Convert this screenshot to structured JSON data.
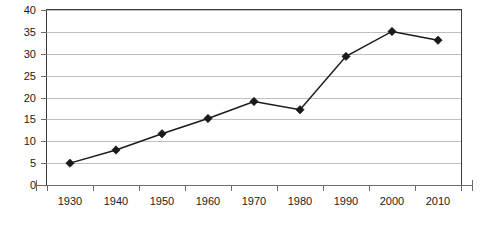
{
  "chart_data": {
    "type": "line",
    "title": "",
    "subtitle": "",
    "xlabel": "",
    "ylabel": "",
    "categories": [
      "1930",
      "1940",
      "1950",
      "1960",
      "1970",
      "1980",
      "1990",
      "2000",
      "2010"
    ],
    "values": [
      5.0,
      8.0,
      11.7,
      15.2,
      19.1,
      17.2,
      29.4,
      35.1,
      33.1
    ],
    "series": [
      {
        "name": "Series 1",
        "values": [
          5.0,
          8.0,
          11.7,
          15.2,
          19.1,
          17.2,
          29.4,
          35.1,
          33.1
        ],
        "color": "#1a1a1a",
        "marker": "diamond"
      }
    ],
    "ylim": [
      0,
      40
    ],
    "ytick_step": 5,
    "ytick_labels": [
      "0",
      "5",
      "10",
      "15",
      "20",
      "25",
      "30",
      "35",
      "40"
    ],
    "ytick_values": [
      0,
      5,
      10,
      15,
      20,
      25,
      30,
      35,
      40
    ],
    "xtick_labels": [
      "1930",
      "1940",
      "1950",
      "1960",
      "1970",
      "1980",
      "1990",
      "2000",
      "2010"
    ],
    "grid": true,
    "grid_axis": "y",
    "legend": false,
    "legend_position": "none",
    "annotations": []
  },
  "style": {
    "background": "#ffffff",
    "grid_color": "#bfbfbf",
    "border_color": "#3a3a3a",
    "axis_color": "#6b6b6b",
    "text_color": "#1a1a1a",
    "series_color": "#1a1a1a"
  }
}
